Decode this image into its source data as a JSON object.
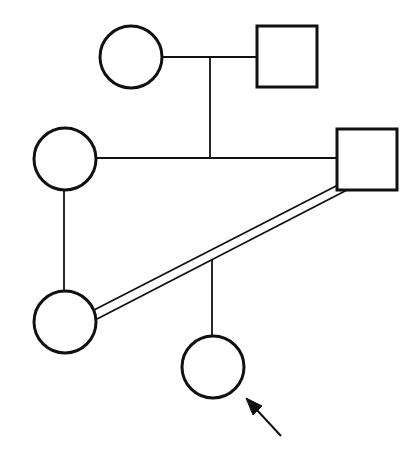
{
  "diagram": {
    "type": "pedigree",
    "colors": {
      "stroke": "#111111",
      "background": "#ffffff"
    },
    "individuals": [
      {
        "id": "I-1",
        "sex": "female",
        "shape": "circle",
        "generation": 1,
        "cx": 131,
        "cy": 57,
        "r": 31
      },
      {
        "id": "I-2",
        "sex": "male",
        "shape": "square",
        "generation": 1,
        "x": 257,
        "y": 26,
        "size": 61
      },
      {
        "id": "II-1",
        "sex": "female",
        "shape": "circle",
        "generation": 2,
        "cx": 65,
        "cy": 159,
        "r": 31
      },
      {
        "id": "II-2",
        "sex": "male",
        "shape": "square",
        "generation": 2,
        "x": 337,
        "y": 129,
        "size": 61
      },
      {
        "id": "III-1",
        "sex": "female",
        "shape": "circle",
        "generation": 3,
        "cx": 65,
        "cy": 322,
        "r": 31
      },
      {
        "id": "IV-1",
        "sex": "female",
        "shape": "circle",
        "generation": 4,
        "cx": 213,
        "cy": 367,
        "r": 31,
        "proband": true
      }
    ],
    "relationships": [
      {
        "type": "mating",
        "between": [
          "I-1",
          "I-2"
        ]
      },
      {
        "type": "offspring",
        "of": [
          "I-1",
          "I-2"
        ],
        "children": [
          "II-1",
          "II-2"
        ],
        "sibship": "siblings"
      },
      {
        "type": "parent-child",
        "parent": "II-1",
        "child": "III-1"
      },
      {
        "type": "consanguineous-mating",
        "between": [
          "III-1",
          "II-2"
        ],
        "line": "double"
      },
      {
        "type": "offspring",
        "of": [
          "III-1",
          "II-2"
        ],
        "children": [
          "IV-1"
        ]
      }
    ],
    "proband_marker": {
      "target": "IV-1",
      "symbol": "arrow"
    }
  }
}
